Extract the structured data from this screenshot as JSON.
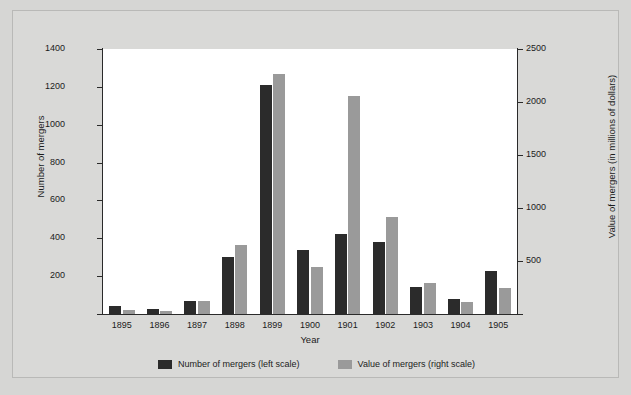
{
  "chart_data": {
    "type": "bar",
    "title": "",
    "xlabel": "Year",
    "ylabel": "Number of mergers",
    "y2label": "Value of mergers (in millions of dollars)",
    "categories": [
      "1895",
      "1896",
      "1897",
      "1898",
      "1899",
      "1900",
      "1901",
      "1902",
      "1903",
      "1904",
      "1905"
    ],
    "ylim": [
      0,
      1400
    ],
    "y2lim": [
      0,
      2500
    ],
    "yticks": [
      0,
      200,
      400,
      600,
      800,
      1000,
      1200,
      1400
    ],
    "ytick_labels": [
      "",
      "200",
      "400",
      "600",
      "800",
      "1000",
      "1200",
      "1400"
    ],
    "y2ticks": [
      0,
      500,
      1000,
      1500,
      2000,
      2500
    ],
    "y2tick_labels": [
      "",
      "500",
      "1000",
      "1500",
      "2000",
      "2500"
    ],
    "grid": false,
    "legend_position": "bottom",
    "series": [
      {
        "name": "Number of mergers (left scale)",
        "axis": "left",
        "color": "#2b2b2b",
        "values": [
          43,
          26,
          69,
          303,
          1208,
          340,
          423,
          379,
          142,
          79,
          226
        ]
      },
      {
        "name": "Value of mergers (right scale)",
        "axis": "right",
        "color": "#9a9a9a",
        "values": [
          41,
          25,
          119,
          651,
          2262,
          442,
          2053,
          911,
          297,
          111,
          243
        ]
      }
    ]
  },
  "legend": {
    "items": [
      {
        "label": "Number of mergers (left scale)",
        "color": "#2b2b2b",
        "swatch_name": "legend-swatch-number"
      },
      {
        "label": "Value of mergers (right scale)",
        "color": "#9a9a9a",
        "swatch_name": "legend-swatch-value"
      }
    ]
  },
  "colors": {
    "background": "#d9d9d7",
    "plot_background": "#ffffff",
    "axis": "#2a2a2a",
    "series_dark": "#2b2b2b",
    "series_light": "#9a9a9a"
  }
}
